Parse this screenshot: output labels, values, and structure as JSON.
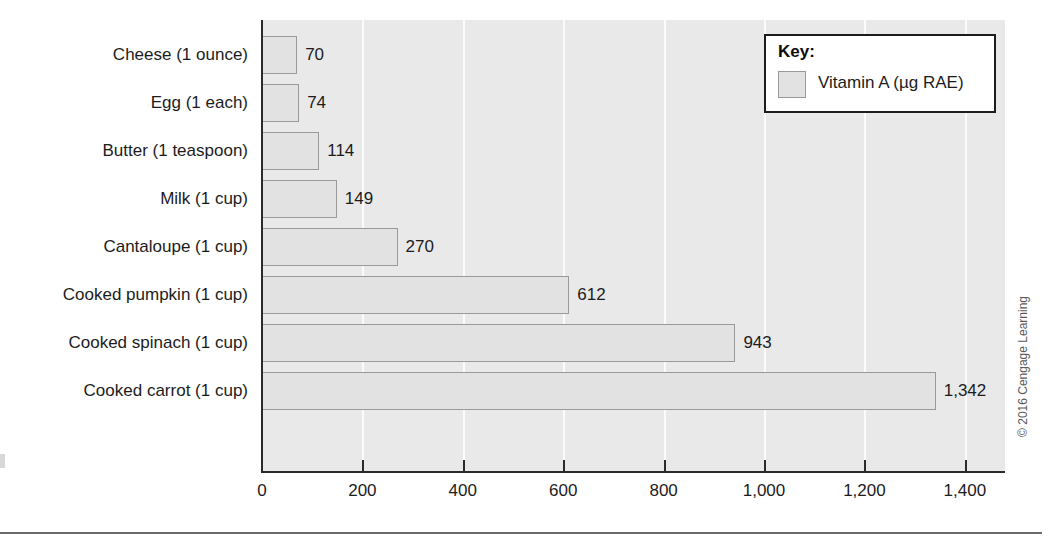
{
  "chart_data": {
    "type": "bar",
    "orientation": "horizontal",
    "title": "",
    "xlabel": "",
    "ylabel": "",
    "xlim": [
      0,
      1480
    ],
    "grid": "vertical",
    "legend_position": "top-right",
    "categories": [
      "Cheese (1 ounce)",
      "Egg (1 each)",
      "Butter (1 teaspoon)",
      "Milk (1 cup)",
      "Cantaloupe (1 cup)",
      "Cooked pumpkin (1 cup)",
      "Cooked spinach (1 cup)",
      "Cooked carrot (1 cup)"
    ],
    "values": [
      70,
      74,
      114,
      149,
      270,
      612,
      943,
      1342
    ],
    "value_labels": [
      "70",
      "74",
      "114",
      "149",
      "270",
      "612",
      "943",
      "1,342"
    ],
    "series": [
      {
        "name": "Vitamin A (µg RAE)",
        "values": [
          70,
          74,
          114,
          149,
          270,
          612,
          943,
          1342
        ]
      }
    ],
    "xticks": [
      0,
      200,
      400,
      600,
      800,
      1000,
      1200,
      1400
    ],
    "xtick_labels": [
      "0",
      "200",
      "400",
      "600",
      "800",
      "1,000",
      "1,200",
      "1,400"
    ],
    "colors": {
      "bar_fill": "#e2e2e2",
      "bar_border": "#9a9a9a",
      "plot_background": "#e9e9e9",
      "gridline": "#fbfbfb",
      "axis": "#2b2b2b",
      "text": "#1c1c1c"
    }
  },
  "legend": {
    "title": "Key:",
    "series_label": "Vitamin A (µg RAE)"
  },
  "footer": {
    "copyright": "© 2016 Cengage Learning"
  }
}
